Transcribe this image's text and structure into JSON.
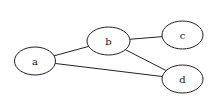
{
  "diagram": {
    "type": "undirected-graph",
    "background": "#ffffff",
    "stroke_color": "#222222",
    "nodes": [
      {
        "id": "a",
        "label": "a",
        "cx": 35,
        "cy": 61,
        "rx": 20.5,
        "ry": 14
      },
      {
        "id": "b",
        "label": "b",
        "cx": 108.5,
        "cy": 41,
        "rx": 21.5,
        "ry": 14
      },
      {
        "id": "c",
        "label": "c",
        "cx": 182.5,
        "cy": 35,
        "rx": 20.5,
        "ry": 14
      },
      {
        "id": "d",
        "label": "d",
        "cx": 182.5,
        "cy": 79,
        "rx": 20.5,
        "ry": 14
      }
    ],
    "edges": [
      {
        "from": "a",
        "to": "b"
      },
      {
        "from": "a",
        "to": "d"
      },
      {
        "from": "b",
        "to": "c"
      },
      {
        "from": "b",
        "to": "d"
      }
    ]
  }
}
